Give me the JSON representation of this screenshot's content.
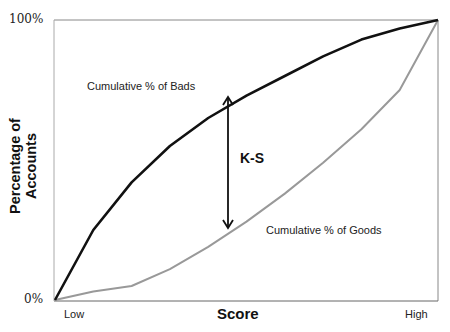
{
  "chart_data": {
    "type": "line",
    "title": "",
    "xlabel": "Score",
    "ylabel": "Percentage of Accounts",
    "x_tick_labels": [
      "Low",
      "High"
    ],
    "y_tick_labels": [
      "0%",
      "100%"
    ],
    "ylim": [
      0,
      100
    ],
    "grid": false,
    "x": [
      0,
      1,
      2,
      3,
      4,
      5,
      6,
      7,
      8,
      9,
      10
    ],
    "series": [
      {
        "name": "Cumulative % of Bads",
        "color": "#111111",
        "values": [
          0,
          25,
          42,
          55,
          65,
          73,
          80,
          87,
          93,
          97,
          100
        ]
      },
      {
        "name": "Cumulative % of Goods",
        "color": "#999999",
        "values": [
          0,
          3,
          5,
          11,
          19,
          28,
          38,
          49,
          61,
          75,
          100
        ]
      }
    ],
    "annotations": [
      {
        "text": "K-S",
        "type": "double-arrow",
        "x": 4.5,
        "from": 28,
        "to": 73
      }
    ]
  },
  "labels": {
    "y_top": "100%",
    "y_bottom": "0%",
    "x_low": "Low",
    "x_high": "High",
    "xlabel": "Score",
    "ylabel": "Percentage of Accounts",
    "bads": "Cumulative % of Bads",
    "goods": "Cumulative % of Goods",
    "ks": "K-S"
  }
}
